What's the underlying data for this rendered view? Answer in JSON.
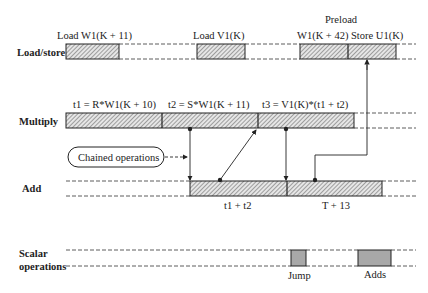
{
  "diagram": {
    "type": "timing-diagram",
    "colors": {
      "line": "#222222",
      "hatch_bg": "#e6e6e6",
      "scalar_fill": "#a8a8a8"
    },
    "rows": [
      {
        "id": "load_store",
        "label": "Load/store"
      },
      {
        "id": "multiply",
        "label": "Multiply"
      },
      {
        "id": "add",
        "label": "Add"
      },
      {
        "id": "scalar",
        "label_line1": "Scalar",
        "label_line2": "operations"
      }
    ],
    "load_store": {
      "op1_label": "Load W1(K + 11)",
      "op2_label": "Load V1(K)",
      "op3_label_line1": "Preload",
      "op3_label_line2": "W1(K + 42) Store U1(K)"
    },
    "multiply": {
      "op1_label": "t1 = R*W1(K + 10)",
      "op2_label": "t2 = S*W1(K + 11)",
      "op3_label": "t3 = V1(K)*(t1 + t2)"
    },
    "add": {
      "op1_label": "t1 + t2",
      "op2_label": "T + 13"
    },
    "scalar": {
      "op1_label": "Jump",
      "op2_label": "Adds"
    },
    "callout": {
      "label": "Chained operations",
      "icon": "rounded-box"
    }
  }
}
